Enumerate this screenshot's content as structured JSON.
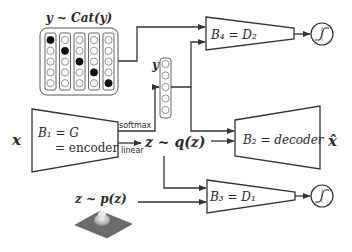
{
  "diagram": {
    "categorical_prior": {
      "label": "y ~ Cat(y)",
      "columns": 5,
      "rows": 5,
      "active_indices": [
        0,
        1,
        2,
        3,
        4
      ]
    },
    "input": {
      "label": "x"
    },
    "encoder": {
      "label_line1": "B₁ = G",
      "label_line2": "= encoder"
    },
    "encoder_outputs": {
      "softmax": "softmax",
      "linear": "linear"
    },
    "categorical_latent": {
      "label": "y",
      "cells": 5
    },
    "continuous_latent": {
      "label": "z ~ q(z)"
    },
    "decoder": {
      "label": "B₂ = decoder"
    },
    "reconstruction": {
      "label": "x̂"
    },
    "discriminator_top": {
      "label": "B₄ = D₂",
      "output_icon": "sigmoid-icon"
    },
    "prior_sample": {
      "label": "z ~ p(z)",
      "icon": "gaussian-surface-icon"
    },
    "discriminator_bottom": {
      "label": "B₃ = D₁",
      "output_icon": "sigmoid-icon"
    },
    "colors": {
      "stroke": "#333333",
      "fill": "#ffffff",
      "active_cell": "#111111"
    }
  }
}
